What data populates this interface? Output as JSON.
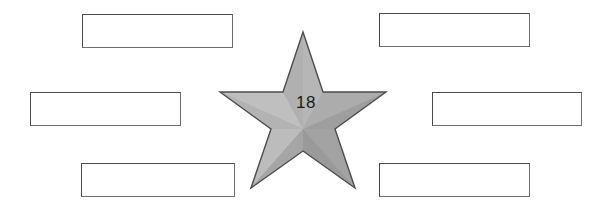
{
  "worksheet": {
    "title": "Star graphic organizer with six blank answer boxes",
    "background_color": "#ffffff",
    "width": 611,
    "height": 216
  },
  "center_shape": {
    "type": "five-pointed-star",
    "label": "18",
    "fill_color": "#a9a9a9",
    "highlight_color": "#bdbdbd",
    "shadow_color": "#949494",
    "outline_color": "#4d4d4d",
    "text_color": "#1b1b1b"
  },
  "boxes": [
    {
      "id": "box-top-left",
      "side": "left",
      "row": "top",
      "value": "",
      "placeholder": ""
    },
    {
      "id": "box-middle-left",
      "side": "left",
      "row": "middle",
      "value": "",
      "placeholder": ""
    },
    {
      "id": "box-bottom-left",
      "side": "left",
      "row": "bottom",
      "value": "",
      "placeholder": ""
    },
    {
      "id": "box-top-right",
      "side": "right",
      "row": "top",
      "value": "",
      "placeholder": ""
    },
    {
      "id": "box-middle-right",
      "side": "right",
      "row": "middle",
      "value": "",
      "placeholder": ""
    },
    {
      "id": "box-bottom-right",
      "side": "right",
      "row": "bottom",
      "value": "",
      "placeholder": ""
    }
  ]
}
